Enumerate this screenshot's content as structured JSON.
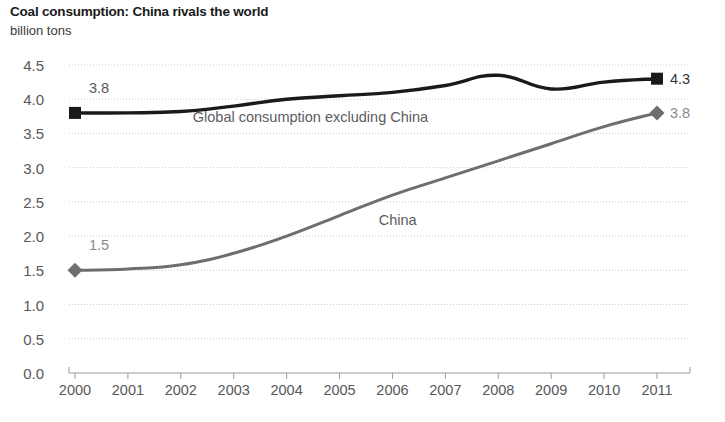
{
  "chart_data": {
    "type": "line",
    "title": "Coal consumption: China rivals the world",
    "subtitle": "billion tons",
    "xlabel": "",
    "ylabel": "billion tons",
    "ylim": [
      0.0,
      4.5
    ],
    "ytick_labels": [
      "0.0",
      "0.5",
      "1.0",
      "1.5",
      "2.0",
      "2.5",
      "3.0",
      "3.5",
      "4.0",
      "4.5"
    ],
    "ytick_values": [
      0.0,
      0.5,
      1.0,
      1.5,
      2.0,
      2.5,
      3.0,
      3.5,
      4.0,
      4.5
    ],
    "grid": true,
    "legend_position": "inline-annotation",
    "categories": [
      "2000",
      "2001",
      "2002",
      "2003",
      "2004",
      "2005",
      "2006",
      "2007",
      "2008",
      "2009",
      "2010",
      "2011"
    ],
    "x": [
      2000,
      2001,
      2002,
      2003,
      2004,
      2005,
      2006,
      2007,
      2008,
      2009,
      2010,
      2011
    ],
    "series": [
      {
        "name": "Global consumption excluding China",
        "color": "#1a1a1a",
        "marker": "square",
        "values": [
          3.8,
          3.8,
          3.82,
          3.9,
          4.0,
          4.05,
          4.1,
          4.2,
          4.35,
          4.15,
          4.25,
          4.3
        ]
      },
      {
        "name": "China",
        "color": "#6e6e70",
        "marker": "diamond",
        "values": [
          1.5,
          1.52,
          1.58,
          1.75,
          2.0,
          2.3,
          2.6,
          2.85,
          3.1,
          3.35,
          3.6,
          3.8
        ]
      }
    ],
    "annotations": [
      {
        "id": "global-start",
        "text": "3.8",
        "x": 2000,
        "y": 3.8,
        "color": "#58585a",
        "placement": "above"
      },
      {
        "id": "global-end",
        "text": "4.3",
        "x": 2011,
        "y": 4.3,
        "color": "#333333",
        "placement": "right"
      },
      {
        "id": "china-start",
        "text": "1.5",
        "x": 2000,
        "y": 1.5,
        "color": "#8a8a8c",
        "placement": "above"
      },
      {
        "id": "china-end",
        "text": "3.8",
        "x": 2011,
        "y": 3.8,
        "color": "#8a8a8c",
        "placement": "right"
      },
      {
        "id": "global-series-label",
        "text": "Global consumption excluding China",
        "x": 2004.45,
        "y": 3.74,
        "color": "#5c5c5e",
        "placement": "inline"
      },
      {
        "id": "china-series-label",
        "text": "China",
        "x": 2006.1,
        "y": 2.23,
        "color": "#5c5c5e",
        "placement": "inline"
      }
    ]
  }
}
